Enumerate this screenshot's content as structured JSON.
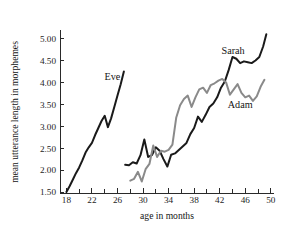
{
  "chart_data": {
    "type": "line",
    "title": "",
    "xlabel": "age in months",
    "ylabel": "mean utterance length in morphemes",
    "xlim": [
      17,
      50.5
    ],
    "ylim": [
      1.5,
      5.15
    ],
    "grid": false,
    "legend": "inline-labels",
    "xticks": [
      18,
      22,
      26,
      30,
      34,
      38,
      42,
      46,
      50
    ],
    "xtick_labels": [
      "18",
      "22",
      "26",
      "30",
      "34",
      "38",
      "42",
      "46",
      "50"
    ],
    "xticks_minor": [
      20,
      24,
      28,
      32,
      36,
      40,
      44,
      48
    ],
    "yticks": [
      1.5,
      2.0,
      2.5,
      3.0,
      3.5,
      4.0,
      4.5,
      5.0
    ],
    "ytick_labels": [
      "1.50",
      "2.00",
      "2.50",
      "3.00",
      "3.50",
      "4.00",
      "4.50",
      "5.00"
    ],
    "series": [
      {
        "name": "Eve",
        "color": "#1a1a1a",
        "width": 2.0,
        "label_x": 25.2,
        "label_y": 4.06,
        "x": [
          18,
          18.5,
          19,
          19.5,
          20,
          20.5,
          21,
          21.5,
          22,
          22.5,
          23,
          23.5,
          24,
          24.5,
          25,
          25.5,
          26,
          26.5,
          27
        ],
        "y": [
          1.5,
          1.63,
          1.78,
          1.93,
          2.06,
          2.22,
          2.4,
          2.52,
          2.62,
          2.8,
          2.96,
          3.12,
          3.24,
          2.98,
          3.18,
          3.44,
          3.7,
          3.96,
          4.25
        ]
      },
      {
        "name": "Sarah",
        "color": "#1a1a1a",
        "width": 2.0,
        "label_x": 44.1,
        "label_y": 4.64,
        "x": [
          27.2,
          27.8,
          28.4,
          29.0,
          29.6,
          30.2,
          30.8,
          31.4,
          32.0,
          32.6,
          33.2,
          33.8,
          34.4,
          35.0,
          35.6,
          36.2,
          36.8,
          37.4,
          38.0,
          38.6,
          39.2,
          39.8,
          40.4,
          41.0,
          41.6,
          42.2,
          42.8,
          43.4,
          44.0,
          44.6,
          45.2,
          45.8,
          46.4,
          47.0,
          47.6,
          48.2,
          48.8,
          49.3
        ],
        "y": [
          2.12,
          2.11,
          2.18,
          2.15,
          2.34,
          2.7,
          2.3,
          2.34,
          2.52,
          2.44,
          2.25,
          2.08,
          2.35,
          2.38,
          2.46,
          2.54,
          2.62,
          2.82,
          2.96,
          3.22,
          3.1,
          3.26,
          3.44,
          3.52,
          3.66,
          3.88,
          4.02,
          4.28,
          4.58,
          4.54,
          4.44,
          4.48,
          4.46,
          4.44,
          4.5,
          4.58,
          4.82,
          5.1
        ]
      },
      {
        "name": "Adam",
        "color": "#8a8a8a",
        "width": 2.0,
        "label_x": 45.2,
        "label_y": 3.42,
        "x": [
          28.0,
          28.6,
          29.2,
          29.8,
          30.4,
          31.0,
          31.6,
          32.2,
          32.8,
          33.4,
          34.0,
          34.6,
          35.2,
          35.8,
          36.4,
          37.0,
          37.6,
          38.2,
          38.8,
          39.4,
          40.0,
          40.6,
          41.2,
          41.8,
          42.4,
          43.0,
          43.6,
          44.2,
          44.8,
          45.4,
          46.0,
          46.6,
          47.2,
          47.8,
          48.4,
          49.0
        ],
        "y": [
          1.76,
          1.8,
          1.96,
          1.74,
          2.02,
          2.14,
          2.56,
          2.3,
          2.44,
          2.42,
          2.46,
          2.58,
          3.2,
          3.48,
          3.62,
          3.7,
          3.44,
          3.66,
          3.84,
          3.88,
          3.76,
          3.94,
          3.98,
          4.04,
          4.08,
          4.0,
          3.72,
          3.84,
          3.96,
          3.76,
          3.66,
          3.7,
          3.58,
          3.68,
          3.9,
          4.06
        ]
      }
    ]
  }
}
